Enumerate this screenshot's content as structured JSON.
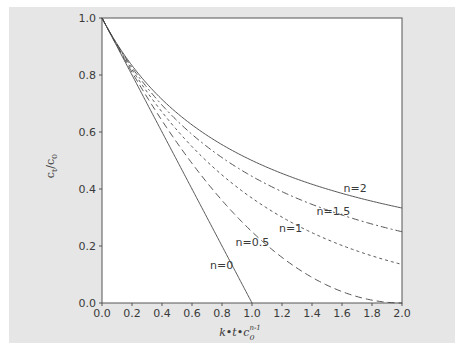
{
  "chart_data": {
    "type": "line",
    "title": "",
    "xlabel": "k·t·c0^(n-1)",
    "ylabel": "ct/c0",
    "xlim": [
      0.0,
      2.0
    ],
    "ylim": [
      0.0,
      1.0
    ],
    "x_ticks": [
      "0.0",
      "0.2",
      "0.4",
      "0.6",
      "0.8",
      "1.0",
      "1.2",
      "1.4",
      "1.6",
      "1.8",
      "2.0"
    ],
    "y_ticks": [
      "0.0",
      "0.2",
      "0.4",
      "0.6",
      "0.8",
      "1.0"
    ],
    "grid": false,
    "legend": "inline curve labels",
    "x": [
      0.0,
      0.2,
      0.4,
      0.6,
      0.8,
      1.0,
      1.2,
      1.4,
      1.6,
      1.8,
      2.0
    ],
    "series": [
      {
        "name": "n=0",
        "style": "solid",
        "values": [
          1.0,
          0.8,
          0.6,
          0.4,
          0.2,
          0.0,
          null,
          null,
          null,
          null,
          null
        ]
      },
      {
        "name": "n=0.5",
        "style": "long-dash",
        "values": [
          1.0,
          0.81,
          0.64,
          0.49,
          0.36,
          0.25,
          0.16,
          0.09,
          0.04,
          0.01,
          0.0
        ]
      },
      {
        "name": "n=1",
        "style": "short-dash",
        "values": [
          1.0,
          0.819,
          0.67,
          0.549,
          0.449,
          0.368,
          0.301,
          0.247,
          0.202,
          0.165,
          0.135
        ]
      },
      {
        "name": "n=1.5",
        "style": "dash-dot",
        "values": [
          1.0,
          0.826,
          0.694,
          0.592,
          0.51,
          0.444,
          0.391,
          0.346,
          0.309,
          0.277,
          0.25
        ]
      },
      {
        "name": "n=2",
        "style": "solid",
        "values": [
          1.0,
          0.833,
          0.714,
          0.625,
          0.556,
          0.5,
          0.455,
          0.417,
          0.385,
          0.357,
          0.333
        ]
      }
    ],
    "annotations": [
      {
        "text": "n=2",
        "x": 1.61,
        "y": 0.39
      },
      {
        "text": "n=1.5",
        "x": 1.43,
        "y": 0.31
      },
      {
        "text": "n=1",
        "x": 1.18,
        "y": 0.25
      },
      {
        "text": "n=0.5",
        "x": 0.89,
        "y": 0.2
      },
      {
        "text": "n=0",
        "x": 0.72,
        "y": 0.12
      }
    ]
  },
  "labels": {
    "ylabel_main": "c",
    "ylabel_sub1": "t",
    "ylabel_slash": "/c",
    "ylabel_sub2": "0",
    "xlabel_main": "k•t•c",
    "xlabel_sub": "0",
    "xlabel_sup": "n-1"
  }
}
